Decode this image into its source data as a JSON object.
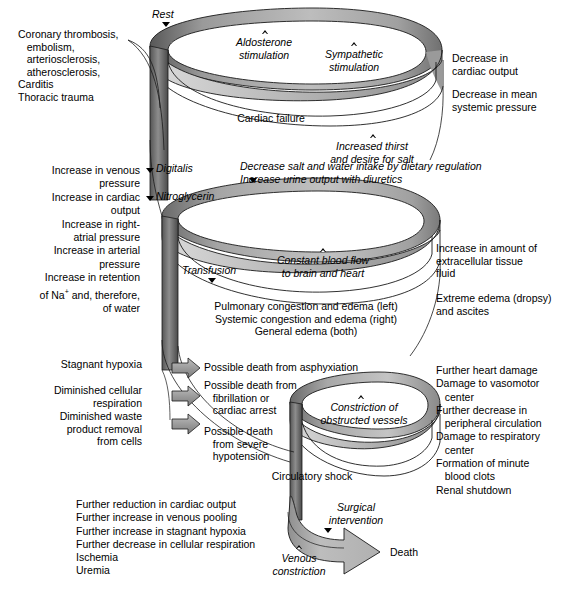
{
  "diagram": {
    "colors": {
      "ribbon_light": "#c9c9c9",
      "ribbon_mid": "#a8a8a8",
      "ribbon_dark": "#6e6e6e",
      "ribbon_edge": "#2b2b2b",
      "arrow_fill": "#9a9a9a",
      "line": "#000000",
      "background": "#ffffff"
    },
    "marker_legend": {
      "solid_triangle": "intervention / therapy input",
      "hollow_triangle": "compensatory mechanism"
    }
  },
  "loop1": {
    "rest_label": "Rest",
    "aldosterone_label": "Aldosterone\nstimulation",
    "sympathetic_label": "Sympathetic\nstimulation",
    "cardiac_failure_label": "Cardiac failure",
    "increased_thirst_label": "Increased thirst\nand desire for salt"
  },
  "causes_left": "Coronary thrombosis,\n   embolism,\n   arteriosclerosis,\n   atherosclerosis,\nCarditis\nThoracic trauma",
  "outputs_right_1": "Decrease in\ncardiac output",
  "outputs_right_2": "Decrease in mean\nsystemic pressure",
  "loop2": {
    "digitalis_label": "Digitalis",
    "nitroglycerin_label": "Nitroglycerin",
    "dietary_label": "Decrease salt and water intake by dietary regulation\nIncrease urine output with diuretics",
    "transfusion_label": "Transfusion",
    "constant_flow_label": "Constant blood flow\nto brain and heart",
    "congestion_label": "Pulmonary congestion and edema (left)\nSystemic congestion and edema (right)\nGeneral edema (both)"
  },
  "compensation_left": "Increase in venous\n      pressure\nIncrease in cardiac\n      output\n   Increase in right-\n      atrial pressure\n   Increase in arterial\n      pressure\nIncrease in retention\n   of Na+ and, therefore,\n   of water",
  "compensation_left_line1": "Increase in venous",
  "compensation_left_line2": "pressure",
  "compensation_left_line3": "Increase in cardiac",
  "compensation_left_line4": "output",
  "compensation_left_line5": "Increase in right-",
  "compensation_left_line6": "atrial pressure",
  "compensation_left_line7": "Increase in arterial",
  "compensation_left_line8": "pressure",
  "compensation_left_line9": "Increase in retention",
  "compensation_left_line10": "of Na",
  "compensation_left_line10sup": "+",
  "compensation_left_line10b": " and, therefore,",
  "compensation_left_line11": "of water",
  "edema_right_1": "Increase in amount of\nextracellular tissue\nfluid",
  "edema_right_2": "Extreme edema (dropsy)\nand ascites",
  "hypoxia_left": "Stagnant hypoxia\n\nDiminished cellular\n   respiration\nDiminished waste\n   product removal\n   from cells",
  "hypoxia_left_l1": "Stagnant hypoxia",
  "hypoxia_left_l2": "Diminished cellular",
  "hypoxia_left_l3": "respiration",
  "hypoxia_left_l4": "Diminished waste",
  "hypoxia_left_l5": "product removal",
  "hypoxia_left_l6": "from cells",
  "deaths": {
    "d1": "Possible death from asphyxiation",
    "d2a": "Possible death from",
    "d2b": "fibrillation or",
    "d2c": "cardiac arrest",
    "d3a": "Possible death",
    "d3b": "from severe",
    "d3c": "hypotension"
  },
  "loop3": {
    "constriction_label": "Constriction of\nobstructed vessels",
    "circulatory_shock_label": "Circulatory shock"
  },
  "damage_right": {
    "l1": "Further heart damage",
    "l2": "Damage to vasomotor",
    "l3": "center",
    "l4": "Further decrease in",
    "l5": "peripheral circulation",
    "l6": "Damage to respiratory",
    "l7": "center",
    "l8": "Formation of minute",
    "l9": "blood clots",
    "l10": "Renal shutdown"
  },
  "decompensation_left": {
    "l1": "Further reduction in cardiac output",
    "l2": "Further increase in venous pooling",
    "l3": "Further increase in stagnant hypoxia",
    "l4": "Further decrease in cellular respiration",
    "l5": "Ischemia",
    "l6": "Uremia"
  },
  "final": {
    "surgical_label": "Surgical\nintervention",
    "venous_constriction_label": "Venous\nconstriction",
    "death_label": "Death"
  },
  "markers": [
    {
      "name": "rest",
      "type": "solid"
    },
    {
      "name": "aldosterone",
      "type": "hollow"
    },
    {
      "name": "sympathetic",
      "type": "hollow"
    },
    {
      "name": "increased-thirst",
      "type": "hollow"
    },
    {
      "name": "digitalis",
      "type": "solid"
    },
    {
      "name": "nitroglycerin",
      "type": "solid"
    },
    {
      "name": "dietary-regulation",
      "type": "solid"
    },
    {
      "name": "transfusion",
      "type": "solid"
    },
    {
      "name": "constant-blood-flow",
      "type": "hollow"
    },
    {
      "name": "constriction-obstructed-vessels",
      "type": "hollow"
    },
    {
      "name": "surgical-intervention",
      "type": "solid"
    },
    {
      "name": "venous-constriction",
      "type": "hollow"
    }
  ]
}
